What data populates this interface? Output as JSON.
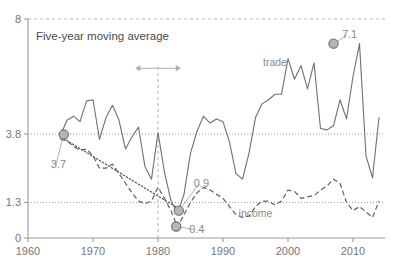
{
  "chart_data": {
    "type": "line",
    "title": "Five-year moving average",
    "xlabel": "",
    "ylabel": "",
    "xlim": [
      1960,
      2015
    ],
    "ylim": [
      0,
      8
    ],
    "grid": true,
    "legend_position": "inline-labels",
    "xticks": [
      1960,
      1970,
      1980,
      1990,
      2000,
      2010
    ],
    "xtick_labels": [
      "1960",
      "1970",
      "1980",
      "1990",
      "2000",
      "2010"
    ],
    "yticks": [
      0,
      1.3,
      3.8,
      8
    ],
    "ytick_labels": [
      "0",
      "1.3",
      "3.8",
      "8"
    ],
    "reference_lines": [
      {
        "name": "upper-reference",
        "value": 3.8,
        "style": "dotted"
      },
      {
        "name": "lower-reference",
        "value": 1.3,
        "style": "dotted"
      },
      {
        "name": "top-frame",
        "value": 8,
        "style": "dashed"
      }
    ],
    "vertical_marker": {
      "x": 1980,
      "style": "dashed"
    },
    "series": [
      {
        "name": "trade",
        "label": "trade",
        "style": "solid",
        "label_x": 1998,
        "label_y": 6.3,
        "x": [
          1965,
          1966,
          1967,
          1968,
          1969,
          1970,
          1971,
          1972,
          1973,
          1974,
          1975,
          1976,
          1977,
          1978,
          1979,
          1980,
          1981,
          1982,
          1983,
          1984,
          1985,
          1986,
          1987,
          1988,
          1989,
          1990,
          1991,
          1992,
          1993,
          1994,
          1995,
          1996,
          1997,
          1998,
          1999,
          2000,
          2001,
          2002,
          2003,
          2004,
          2005,
          2006,
          2007,
          2008,
          2009,
          2010,
          2011,
          2012,
          2013,
          2014
        ],
        "values": [
          3.75,
          4.3,
          4.45,
          4.25,
          5.0,
          5.05,
          3.6,
          4.4,
          4.85,
          4.3,
          3.25,
          3.7,
          4.05,
          2.6,
          2.15,
          3.85,
          2.4,
          1.35,
          0.9,
          1.6,
          3.1,
          3.9,
          4.45,
          4.2,
          4.35,
          4.25,
          3.5,
          2.35,
          2.15,
          3.1,
          4.4,
          4.9,
          5.05,
          5.25,
          5.25,
          6.55,
          5.8,
          6.3,
          5.45,
          6.4,
          4.0,
          3.95,
          4.1,
          5.05,
          4.35,
          5.9,
          7.1,
          3.0,
          2.2,
          4.4
        ]
      },
      {
        "name": "income",
        "label": "income",
        "style": "dashed",
        "label_x": 1995,
        "label_y": 0.75,
        "x": [
          1965,
          1966,
          1967,
          1968,
          1969,
          1970,
          1971,
          1972,
          1973,
          1974,
          1975,
          1976,
          1977,
          1978,
          1979,
          1980,
          1981,
          1982,
          1983,
          1984,
          1985,
          1986,
          1987,
          1988,
          1989,
          1990,
          1991,
          1992,
          1993,
          1994,
          1995,
          1996,
          1997,
          1998,
          1999,
          2000,
          2001,
          2002,
          2003,
          2004,
          2005,
          2006,
          2007,
          2008,
          2009,
          2010,
          2011,
          2012,
          2013,
          2014
        ],
        "values": [
          3.6,
          3.55,
          3.35,
          3.2,
          3.25,
          3.0,
          2.55,
          2.55,
          2.7,
          2.35,
          2.0,
          1.65,
          1.35,
          1.25,
          1.35,
          1.85,
          1.45,
          1.0,
          0.4,
          0.85,
          1.3,
          1.65,
          1.85,
          1.75,
          1.6,
          1.45,
          1.15,
          0.85,
          0.75,
          0.8,
          1.15,
          1.35,
          1.35,
          1.2,
          1.35,
          1.75,
          1.7,
          1.45,
          1.5,
          1.55,
          1.75,
          1.9,
          2.15,
          2.0,
          1.3,
          1.0,
          1.15,
          0.95,
          0.75,
          1.35
        ]
      }
    ],
    "trendline": {
      "name": "declining-trend",
      "style": "dotted",
      "x": [
        1965,
        1983
      ],
      "values": [
        3.7,
        1.1
      ]
    },
    "annotations": [
      {
        "name": "annotation-3-7",
        "label": "3.7",
        "x": 1965.5,
        "y": 3.78,
        "label_x": 1963.5,
        "label_y": 2.55,
        "series": "income"
      },
      {
        "name": "annotation-0-9",
        "label": "0.9",
        "x": 1983.2,
        "y": 1.0,
        "label_x": 1985.5,
        "label_y": 1.85,
        "series": "trade"
      },
      {
        "name": "annotation-0-4",
        "label": "0.4",
        "x": 1982.8,
        "y": 0.42,
        "label_x": 1984.8,
        "label_y": 0.2,
        "series": "income"
      },
      {
        "name": "annotation-7-1",
        "label": "7.1",
        "x": 2007.0,
        "y": 7.1,
        "label_x": 2008.3,
        "label_y": 7.3,
        "series": "trade"
      }
    ],
    "span_arrow": {
      "name": "span-arrow",
      "x_start": 1976.5,
      "x_end": 1983.5,
      "y": 6.2
    }
  },
  "colors": {
    "solid_series": "#6f6f6f",
    "dashed_series": "#5e5e5e",
    "marker_fill": "#b6b6b6",
    "marker_stroke": "#6a6a6a",
    "axis": "#9a9a9a",
    "text": "#767676",
    "annotation_text": "#8a8a8a"
  }
}
